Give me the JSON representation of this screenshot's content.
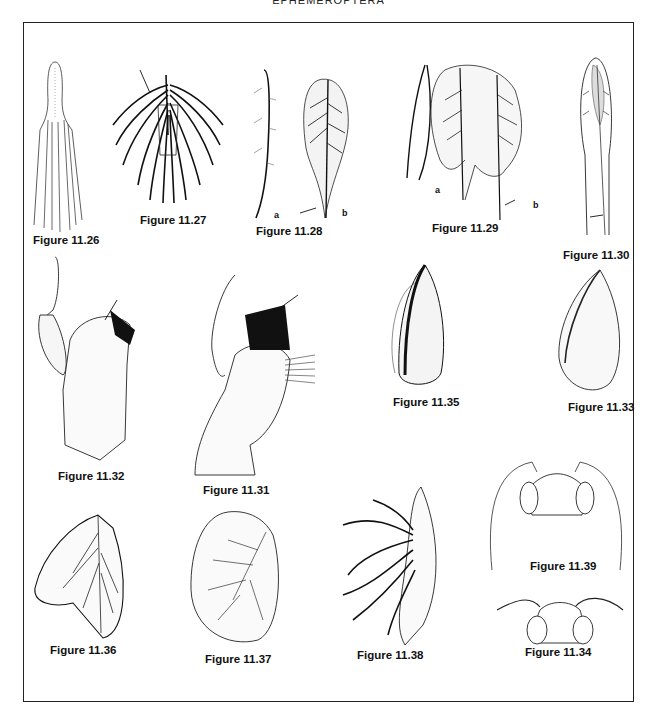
{
  "page": {
    "running_head": "EPHEMEROPTERA"
  },
  "figures": [
    {
      "id": "fig-11-26",
      "caption": "Figure 11.26",
      "subject": "tracheal gill with finger-like filaments"
    },
    {
      "id": "fig-11-27",
      "caption": "Figure 11.27",
      "subject": "fringed gill tuft",
      "arrow": true
    },
    {
      "id": "fig-11-28",
      "caption": "Figure 11.28",
      "subject": "gill lamellae",
      "parts": [
        "a",
        "b"
      ],
      "arrow": true
    },
    {
      "id": "fig-11-29",
      "caption": "Figure 11.29",
      "subject": "gill lamellae",
      "parts": [
        "a",
        "b"
      ],
      "arrow": true
    },
    {
      "id": "fig-11-30",
      "caption": "Figure 11.30",
      "subject": "forked lanceolate gill",
      "arrow": true
    },
    {
      "id": "fig-11-31",
      "caption": "Figure 11.31",
      "subject": "maxilla with comb setae",
      "arrow": true
    },
    {
      "id": "fig-11-32",
      "caption": "Figure 11.32",
      "subject": "maxilla with palp",
      "arrow": true
    },
    {
      "id": "fig-11-33",
      "caption": "Figure 11.33",
      "subject": "oval gill plate"
    },
    {
      "id": "fig-11-34",
      "caption": "Figure 11.34",
      "subject": "sclerotized gill plate"
    },
    {
      "id": "fig-11-35",
      "caption": "Figure 11.35",
      "subject": "double gill lamella"
    },
    {
      "id": "fig-11-36",
      "caption": "Figure 11.36",
      "subject": "rounded gill lamella"
    },
    {
      "id": "fig-11-37",
      "caption": "Figure 11.37",
      "subject": "branched gill"
    },
    {
      "id": "fig-11-38",
      "caption": "Figure 11.38",
      "subject": "head, short antennae"
    },
    {
      "id": "fig-11-39",
      "caption": "Figure 11.39",
      "subject": "head, long antennae"
    }
  ],
  "labels": {
    "a": "a",
    "b": "b"
  }
}
